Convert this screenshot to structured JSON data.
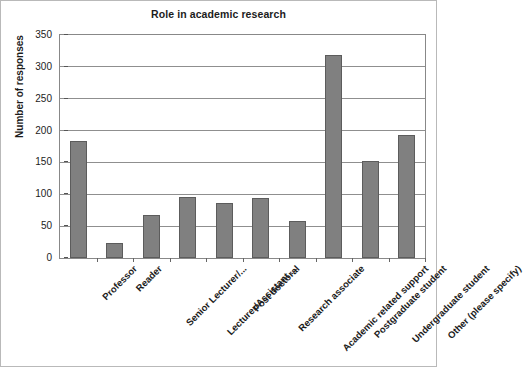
{
  "chart_data": {
    "type": "bar",
    "title": "Role in academic research",
    "xlabel": "",
    "ylabel": "Number of responses",
    "ylim": [
      0,
      350
    ],
    "yticks": [
      0,
      50,
      100,
      150,
      200,
      250,
      300,
      350
    ],
    "grid": true,
    "legend": false,
    "orientation": "vertical",
    "bar_color": "#808080",
    "bar_edge_color": "#5c5c5c",
    "categories": [
      "Professor",
      "Reader",
      "Senior Lecturer/...",
      "Lecturer/Assistant ...",
      "Post doctoral",
      "Research associate",
      "Academic related support",
      "Postgraduate student",
      "Undergraduate student",
      "Other (please specify)"
    ],
    "values": [
      183,
      23,
      68,
      95,
      86,
      94,
      58,
      318,
      153,
      193
    ]
  },
  "figure": {
    "background_color": "#ffffff",
    "border_color": "#b9b9b9",
    "gridline_color": "#8f8f8f",
    "axis_color": "#888888"
  }
}
